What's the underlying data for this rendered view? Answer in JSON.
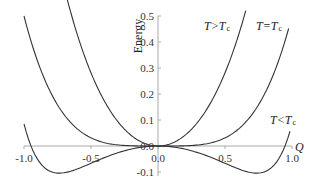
{
  "chart_data": {
    "type": "line",
    "title": "",
    "xlabel": "Q",
    "ylabel": "Energy",
    "xlim": [
      -1.0,
      1.0
    ],
    "ylim": [
      -0.1,
      0.5
    ],
    "x_ticks": [
      "-1.0",
      "-0.5",
      "0.0",
      "0.5",
      "1.0"
    ],
    "y_ticks": [
      "0.5",
      "0.4",
      "0.3",
      "0.2",
      "0.1",
      "0.0",
      "-0.1"
    ],
    "grid": false,
    "legend": "inline labels",
    "series": [
      {
        "name": "T>Tc",
        "label_main": "T>T",
        "label_sub": "c",
        "formula": "E = 1.0 Q^2 + 0.5 Q^4",
        "x": [
          -0.69,
          -0.5,
          -0.3,
          -0.1,
          0.0,
          0.1,
          0.3,
          0.5,
          0.65
        ],
        "values": [
          0.59,
          0.28,
          0.094,
          0.01,
          0.0,
          0.01,
          0.094,
          0.28,
          0.51
        ]
      },
      {
        "name": "T=Tc",
        "label_main": "T=T",
        "label_sub": "c",
        "formula": "E = 0.5 Q^4",
        "x": [
          -1.0,
          -0.75,
          -0.5,
          -0.25,
          0.0,
          0.25,
          0.5,
          0.75,
          0.97
        ],
        "values": [
          0.5,
          0.158,
          0.031,
          0.002,
          0.0,
          0.002,
          0.031,
          0.158,
          0.44
        ]
      },
      {
        "name": "T<Tc",
        "label_main": "T<T",
        "label_sub": "c",
        "x": [
          -1.0,
          -0.94,
          -0.85,
          -0.73,
          -0.5,
          -0.25,
          0.0,
          0.25,
          0.5,
          0.73,
          0.85,
          0.94,
          0.99
        ],
        "values": [
          0.085,
          0.0,
          -0.03,
          -0.05,
          -0.035,
          -0.01,
          0.0,
          -0.01,
          -0.035,
          -0.05,
          -0.03,
          0.0,
          0.085
        ]
      }
    ]
  }
}
